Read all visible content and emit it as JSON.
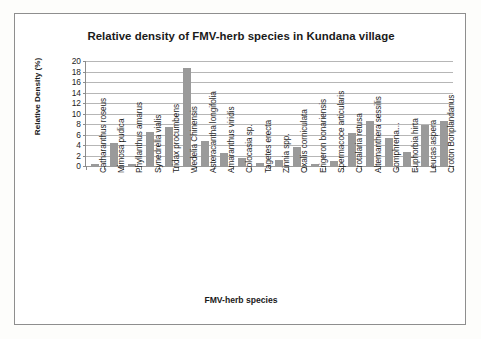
{
  "chart_data": {
    "type": "bar",
    "title": "Relative density of FMV-herb species in Kundana village",
    "xlabel": "FMV-herb species",
    "ylabel": "Relative Density (%)",
    "ylim": [
      0,
      20
    ],
    "ytick_step": 2,
    "yticks": [
      "20",
      "18",
      "16",
      "14",
      "12",
      "10",
      "8",
      "6",
      "4",
      "2",
      "0"
    ],
    "grid": true,
    "legend": "none",
    "bar_color": "#9a9a9a",
    "categories": [
      "Catharanthus roseus",
      "Mimosa pudica",
      "Phyllanthus amarus",
      "Synedrella vialis",
      "Tridax procumbens",
      "Wedelia Chinensis",
      "Asteracantha longifolia",
      "Amaranthus viridis",
      "Colocasia sp.",
      "Tagetes erecta",
      "Zinnia spp.",
      "Oxalis corniculata",
      "Erigeron bonariensis",
      "Spermacoce articularis",
      "Crotalaria retusa",
      "Alternanthera sessilis",
      "Gomphrena…",
      "Euphorbia hirta",
      "Leucas aspera",
      "Croton Bonplandanus"
    ],
    "values": [
      0.4,
      4.3,
      0.3,
      6.5,
      7.5,
      18.6,
      4.8,
      2.4,
      1.5,
      0.6,
      1.2,
      3.6,
      0.4,
      1.0,
      6.2,
      8.6,
      5.4,
      2.6,
      7.9,
      8.5
    ]
  }
}
